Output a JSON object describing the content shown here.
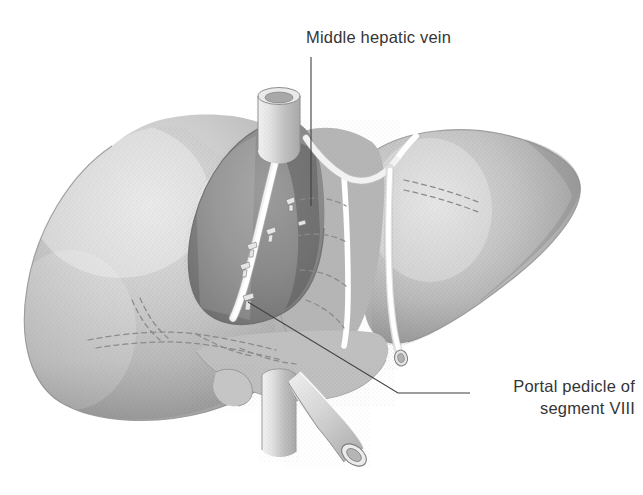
{
  "figure": {
    "view": "anterior view",
    "medium": "grayscale stippled medical illustration",
    "background_color": "#ffffff",
    "ink_color": "#353535"
  },
  "annotations": [
    {
      "id": "middle-hepatic-vein",
      "text": "Middle hepatic vein",
      "text_lines": [
        "Middle hepatic vein"
      ],
      "align": "left",
      "leader": {
        "type": "vertical",
        "from_x": 311,
        "from_y": 57,
        "to_x": 311,
        "to_y": 206
      }
    },
    {
      "id": "portal-pedicle-segment-viii",
      "text": "Portal pedicle of segment VIII",
      "text_lines": [
        "Portal pedicle of",
        "segment VIII"
      ],
      "align": "right",
      "leader": {
        "type": "elbow",
        "from_x": 248,
        "from_y": 302,
        "bend_x": 398,
        "bend_y": 393,
        "to_x": 470,
        "to_y": 393
      }
    }
  ],
  "structures": [
    {
      "name": "left-hepatic-lobe",
      "tone": "#b9b9b9",
      "note": "large left mass, soft gradient shading"
    },
    {
      "name": "right-hepatic-lobe",
      "tone": "#b2b2b2",
      "note": "right lobe tapering to a point at right edge"
    },
    {
      "name": "resection-cavity-segment-viii",
      "tone": "#8a8a8a",
      "note": "dark recessed raw surface where segment VIII was removed"
    },
    {
      "name": "middle-hepatic-vein",
      "tone": "#ffffff",
      "note": "bright white vessel coursing along the cavity border"
    },
    {
      "name": "hepatic-vein-bifurcation",
      "tone": "#ffffff",
      "note": "Y-shaped white vessel branch at upper centre-right"
    },
    {
      "name": "inferior-vena-cava-superior-stump",
      "tone": "#d6d6d6",
      "note": "open cylindrical lumen above the liver"
    },
    {
      "name": "inferior-vena-cava-inferior-stump",
      "tone": "#d2d2d2",
      "note": "vertical cylinder below the liver"
    },
    {
      "name": "portal-vein-stump",
      "tone": "#cfcfcf",
      "note": "angled cut vessel with open lumen, lower right of centre"
    },
    {
      "name": "falciform-band",
      "tone": "#fdfdfd",
      "note": "white band separating right lobe, cut end with lumen"
    },
    {
      "name": "clipped-pedicle-stumps",
      "tone": "#e2e2e2",
      "count": 6,
      "note": "small pale divided vessel stumps on the cavity surface"
    },
    {
      "name": "portal-branch-dashed-lines",
      "tone": "#8d8d8d",
      "note": "dashed lines showing vessels hidden within the parenchyma"
    }
  ],
  "colors": {
    "paper": "#ffffff",
    "text": "#353535",
    "leader_line": "#3f3f3f",
    "liver_light": "#d8d8d8",
    "liver_mid": "#b4b4b4",
    "liver_dark": "#8f8f8f",
    "cavity": "#878787",
    "cavity_shadow": "#6e6e6e",
    "vessel_white": "#ffffff",
    "vessel_gray": "#cccccc",
    "dashed": "#8d8d8d"
  }
}
